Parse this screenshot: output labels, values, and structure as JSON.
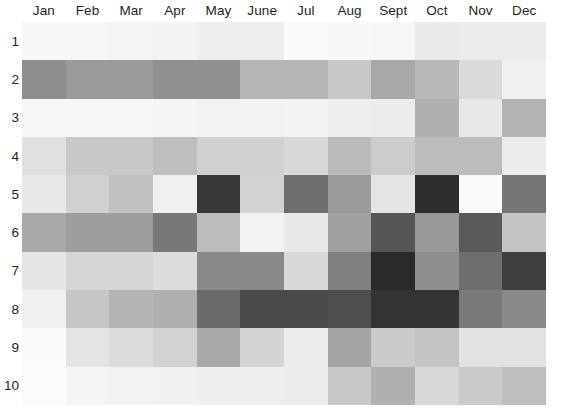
{
  "chart_data": {
    "type": "heatmap",
    "title": "",
    "xlabel": "",
    "ylabel": "",
    "grid": false,
    "legend": "none",
    "colormap": "grayscale",
    "colormap_note": "darker gray = higher value",
    "columns": [
      "Jan",
      "Feb",
      "Mar",
      "Apr",
      "May",
      "June",
      "Jul",
      "Aug",
      "Sept",
      "Oct",
      "Nov",
      "Dec"
    ],
    "rows": [
      "1",
      "2",
      "3",
      "4",
      "5",
      "6",
      "7",
      "8",
      "9",
      "10"
    ],
    "cell_colors": [
      [
        "#f7f7f7",
        "#f6f6f6",
        "#f4f4f4",
        "#f3f3f3",
        "#eeeeee",
        "#eeeeee",
        "#fafafa",
        "#f8f8f8",
        "#f6f6f6",
        "#eaeaea",
        "#ebebeb",
        "#ececec"
      ],
      [
        "#8d8d8d",
        "#9a9a9a",
        "#9a9a9a",
        "#8f8f8f",
        "#8f8f8f",
        "#b5b5b5",
        "#b5b5b5",
        "#c8c8c8",
        "#a8a8a8",
        "#b8b8b8",
        "#dadada",
        "#f0f0f0"
      ],
      [
        "#f7f7f7",
        "#f6f6f6",
        "#f6f6f6",
        "#f5f5f5",
        "#f2f2f2",
        "#f2f2f2",
        "#f3f3f3",
        "#ededed",
        "#ececec",
        "#b0b0b0",
        "#e8e8e8",
        "#b4b4b4"
      ],
      [
        "#e0e0e0",
        "#c8c8c8",
        "#c8c8c8",
        "#bebebe",
        "#d0d0d0",
        "#d0d0d0",
        "#d8d8d8",
        "#bababa",
        "#cccccc",
        "#bcbcbc",
        "#bcbcbc",
        "#ececec"
      ],
      [
        "#e8e8e8",
        "#d0d0d0",
        "#c0c0c0",
        "#f0f0f0",
        "#383838",
        "#d2d2d2",
        "#6e6e6e",
        "#9a9a9a",
        "#e4e4e4",
        "#2e2e2e",
        "#fafafa",
        "#757575"
      ],
      [
        "#a8a8a8",
        "#9e9e9e",
        "#9e9e9e",
        "#787878",
        "#bcbcbc",
        "#f2f2f2",
        "#e8e8e8",
        "#a0a0a0",
        "#555555",
        "#989898",
        "#5a5a5a",
        "#c4c4c4"
      ],
      [
        "#e6e6e6",
        "#d6d6d6",
        "#d6d6d6",
        "#dcdcdc",
        "#8a8a8a",
        "#8a8a8a",
        "#d8d8d8",
        "#808080",
        "#2a2a2a",
        "#8e8e8e",
        "#6e6e6e",
        "#3e3e3e"
      ],
      [
        "#f0f0f0",
        "#c6c6c6",
        "#b4b4b4",
        "#b0b0b0",
        "#6a6a6a",
        "#4a4a4a",
        "#4a4a4a",
        "#4e4e4e",
        "#343434",
        "#343434",
        "#7a7a7a",
        "#8a8a8a"
      ],
      [
        "#fafafa",
        "#e4e4e4",
        "#dcdcdc",
        "#d2d2d2",
        "#a8a8a8",
        "#d4d4d4",
        "#ececec",
        "#a4a4a4",
        "#cacaca",
        "#c4c4c4",
        "#e2e2e2",
        "#e2e2e2"
      ],
      [
        "#fbfbfb",
        "#f4f4f4",
        "#f2f2f2",
        "#f1f1f1",
        "#efefef",
        "#eeeeee",
        "#ececec",
        "#c8c8c8",
        "#b0b0b0",
        "#d8d8d8",
        "#cacaca",
        "#bebebe"
      ]
    ],
    "values": [
      [
        3,
        4,
        4,
        5,
        7,
        7,
        2,
        3,
        4,
        8,
        8,
        7
      ],
      [
        45,
        40,
        40,
        44,
        44,
        29,
        29,
        22,
        35,
        28,
        15,
        6
      ],
      [
        3,
        4,
        4,
        4,
        5,
        5,
        5,
        7,
        7,
        31,
        9,
        30
      ],
      [
        12,
        22,
        22,
        26,
        18,
        18,
        15,
        27,
        20,
        26,
        26,
        7
      ],
      [
        9,
        18,
        24,
        6,
        78,
        17,
        57,
        40,
        11,
        82,
        2,
        54
      ],
      [
        34,
        38,
        38,
        53,
        26,
        5,
        9,
        37,
        67,
        40,
        65,
        23
      ],
      [
        10,
        16,
        16,
        13,
        45,
        45,
        15,
        50,
        84,
        44,
        57,
        76
      ],
      [
        6,
        22,
        29,
        31,
        58,
        71,
        71,
        69,
        80,
        80,
        52,
        46
      ],
      [
        2,
        11,
        13,
        17,
        34,
        17,
        7,
        36,
        21,
        23,
        11,
        11
      ],
      [
        1,
        3,
        5,
        5,
        6,
        7,
        7,
        22,
        31,
        15,
        21,
        25
      ]
    ]
  }
}
